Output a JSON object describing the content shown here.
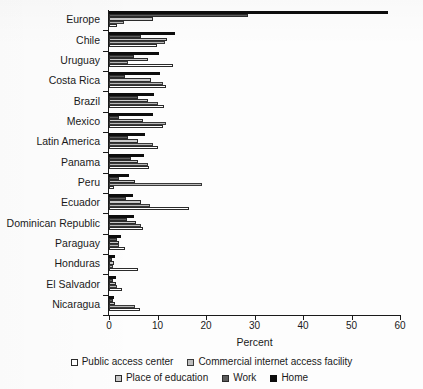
{
  "chart_data": {
    "type": "bar",
    "orientation": "horizontal",
    "grouped": true,
    "title": "",
    "xlabel": "Percent",
    "ylabel": "",
    "xlim": [
      0,
      60
    ],
    "xticks": [
      0,
      10,
      20,
      30,
      40,
      50,
      60
    ],
    "grid": false,
    "legend_position": "bottom",
    "categories": [
      "Europe",
      "Chile",
      "Uruguay",
      "Costa Rica",
      "Brazil",
      "Mexico",
      "Latin America",
      "Panama",
      "Peru",
      "Ecuador",
      "Dominican Republic",
      "Paraguay",
      "Honduras",
      "El Salvador",
      "Nicaragua"
    ],
    "series": [
      {
        "name": "Public access center",
        "key": "public",
        "color": "#ffffff",
        "values": [
          1.6,
          9.9,
          13.1,
          11.8,
          11.3,
          11.2,
          10.1,
          8.3,
          1.0,
          16.4,
          7.0,
          3.3,
          6.0,
          2.6,
          6.3
        ]
      },
      {
        "name": "Commercial internet access facility",
        "key": "commercial",
        "color": "#bdbdbd",
        "values": [
          3.0,
          11.6,
          3.9,
          11.2,
          10.0,
          11.7,
          9.1,
          8.1,
          19.1,
          8.4,
          6.5,
          2.1,
          0.8,
          1.7,
          5.3
        ]
      },
      {
        "name": "Place of education",
        "key": "education",
        "color": "#c9c9c9",
        "values": [
          9.1,
          12.0,
          8.0,
          8.7,
          8.0,
          7.0,
          6.0,
          6.0,
          5.4,
          6.6,
          5.6,
          2.0,
          1.0,
          1.5,
          1.3
        ]
      },
      {
        "name": "Work",
        "key": "work",
        "color": "#5c5c5c",
        "values": [
          28.7,
          6.6,
          5.1,
          3.2,
          6.0,
          2.1,
          4.0,
          4.6,
          2.0,
          3.5,
          3.8,
          1.6,
          0.7,
          0.9,
          0.9
        ]
      },
      {
        "name": "Home",
        "key": "home",
        "color": "#0d0d0d",
        "values": [
          57.5,
          13.6,
          10.3,
          10.6,
          9.3,
          9.1,
          7.5,
          7.2,
          4.2,
          5.0,
          5.2,
          2.4,
          1.2,
          1.5,
          1.1
        ]
      }
    ]
  },
  "axis": {
    "x_title": "Percent",
    "tick_labels": [
      "0",
      "10",
      "20",
      "30",
      "40",
      "50",
      "60"
    ]
  },
  "legend": {
    "row1": [
      {
        "label": "Public access center",
        "key": "public"
      },
      {
        "label": "Commercial internet access facility",
        "key": "commercial"
      }
    ],
    "row2": [
      {
        "label": "Place of education",
        "key": "education"
      },
      {
        "label": "Work",
        "key": "work"
      },
      {
        "label": "Home",
        "key": "home"
      }
    ]
  }
}
